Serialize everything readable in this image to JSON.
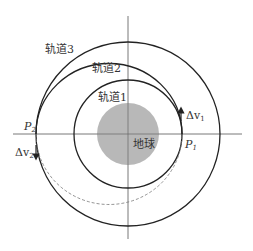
{
  "diagram": {
    "labels": {
      "orbit1": "轨道1",
      "orbit2": "轨道2",
      "orbit3": "轨道3",
      "earth": "地球",
      "p1": "P",
      "p1_sub": "1",
      "p2": "P",
      "p2_sub": "2",
      "dv1": "Δv",
      "dv1_sub": "1",
      "dv2": "Δv",
      "dv2_sub": "2"
    },
    "colors": {
      "earth": "#b8b8b8",
      "orbit": "#222222",
      "axis": "#555555",
      "dashed": "#777777"
    }
  }
}
